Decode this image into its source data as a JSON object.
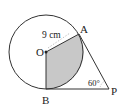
{
  "diagram": {
    "points": {
      "O": {
        "label": "O",
        "x": 46,
        "y": 52
      },
      "A": {
        "label": "A",
        "x": 79,
        "y": 34
      },
      "B": {
        "label": "B",
        "x": 46,
        "y": 89
      },
      "P": {
        "label": "P",
        "x": 109,
        "y": 89
      }
    },
    "circle": {
      "center": "O",
      "radius": 37
    },
    "radius_label": "9 cm",
    "angle_label": "60°",
    "shaded_region": "sector AOB",
    "colors": {
      "line": "#333333",
      "shade": "#c8c8c8",
      "background": "#ffffff"
    }
  }
}
